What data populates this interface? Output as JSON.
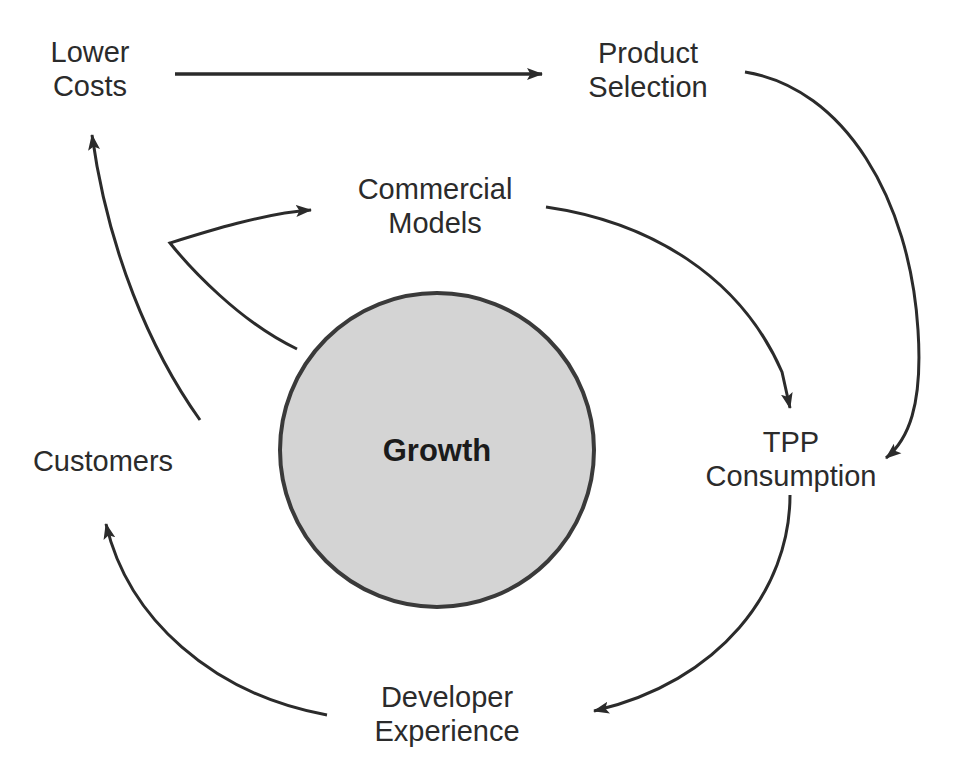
{
  "diagram": {
    "center": {
      "label": "Growth",
      "shape": "circle",
      "fill_color": "#d4d4d4",
      "stroke_color": "#3a3a3a"
    },
    "stroke_color": "#2b2b2b",
    "text_color": "#2b2b2b",
    "background_color": "#ffffff",
    "nodes": [
      {
        "id": "lower-costs",
        "label": "Lower\nCosts"
      },
      {
        "id": "product-selection",
        "label": "Product\nSelection"
      },
      {
        "id": "commercial-models",
        "label": "Commercial\nModels"
      },
      {
        "id": "tpp-consumption",
        "label": "TPP\nConsumption"
      },
      {
        "id": "developer-experience",
        "label": "Developer\nExperience"
      },
      {
        "id": "customers",
        "label": "Customers"
      }
    ],
    "connections": [
      {
        "id": "lower-costs-to-product-selection",
        "from": "Lower Costs",
        "to": "Product Selection",
        "style": "straight-arrow"
      },
      {
        "id": "product-selection-to-tpp-consumption",
        "from": "Product Selection",
        "to": "TPP Consumption",
        "style": "curved-arrow"
      },
      {
        "id": "commercial-models-to-tpp-consumption",
        "from": "Commercial Models",
        "to": "TPP Consumption",
        "style": "curved-arrow"
      },
      {
        "id": "tpp-consumption-to-developer-experience",
        "from": "TPP Consumption",
        "to": "Developer Experience",
        "style": "curved-arrow"
      },
      {
        "id": "developer-experience-to-customers",
        "from": "Developer Experience",
        "to": "Customers",
        "style": "curved-arrow"
      },
      {
        "id": "growth-to-lower-costs",
        "from": "Growth",
        "to": "Lower Costs",
        "style": "curved-arrow"
      },
      {
        "id": "growth-to-commercial-models",
        "from": "Growth",
        "to": "Commercial Models",
        "style": "curved-arrow"
      }
    ]
  },
  "labels": {
    "lower_costs": "Lower\nCosts",
    "product_selection": "Product\nSelection",
    "commercial_models": "Commercial\nModels",
    "tpp_consumption": "TPP\nConsumption",
    "developer_experience": "Developer\nExperience",
    "customers": "Customers",
    "growth": "Growth"
  }
}
